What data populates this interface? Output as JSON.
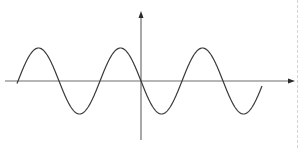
{
  "diagram": {
    "type": "sine-wave-graph",
    "colors": {
      "background": "#ffffff",
      "axis": "#6e6e6e",
      "curve": "#3a3a3a",
      "edge": "#d4d4d4"
    },
    "origin": {
      "x": 141,
      "y": 81
    },
    "x_axis": {
      "x_start": 5,
      "x_end": 295,
      "arrow": "right"
    },
    "y_axis": {
      "y_start": 140,
      "y_end": 11,
      "arrow": "up"
    },
    "curve": {
      "function": "y = -sin(x)",
      "x_start": 17,
      "x_end": 262,
      "period_px": 82,
      "amplitude_px": 33,
      "phase_zero_at_x": 141,
      "direction_at_origin": "down"
    }
  }
}
